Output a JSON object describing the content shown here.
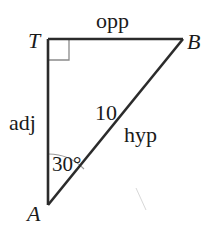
{
  "diagram": {
    "type": "right-triangle",
    "vertices": {
      "T": {
        "label": "T",
        "note": "right angle"
      },
      "B": {
        "label": "B"
      },
      "A": {
        "label": "A"
      }
    },
    "sides": {
      "TB": {
        "label": "opp"
      },
      "TA": {
        "label": "adj"
      },
      "AB": {
        "label": "hyp",
        "length": "10"
      }
    },
    "angle_A": {
      "label": "30°"
    },
    "colors": {
      "line": "#2b2b2b",
      "mark": "#8a8a8a",
      "text": "#1a1a1a"
    }
  }
}
